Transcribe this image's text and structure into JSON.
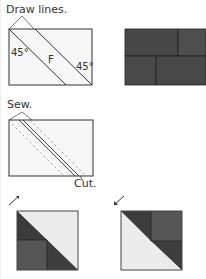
{
  "steps": [
    {
      "label": "Draw lines.",
      "angle_left": "45°",
      "angle_right": "45°",
      "piece_label": "F"
    },
    {
      "label": "Sew.",
      "cut_label": "Cut."
    },
    {
      "result_left": "half-square triangle unit pressed toward light",
      "result_right": "half-square triangle unit pressed toward dark"
    }
  ],
  "colors": {
    "dark": "#3a3a3a",
    "medium": "#555555",
    "light": "#ececec",
    "line": "#333333"
  }
}
